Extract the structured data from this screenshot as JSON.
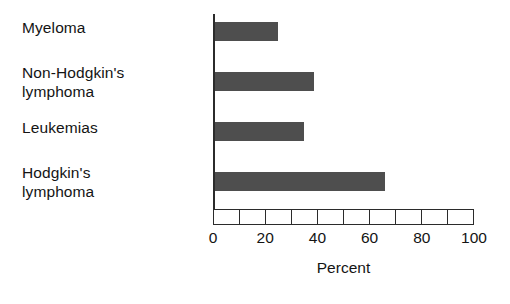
{
  "chart_data": {
    "type": "bar",
    "orientation": "horizontal",
    "title": "",
    "xlabel": "Percent",
    "ylabel": "",
    "categories": [
      "Myeloma",
      "Non-Hodgkin's\nlymphoma",
      "Leukemias",
      "Hodgkin's\nlymphoma"
    ],
    "values": [
      24,
      38,
      34,
      65
    ],
    "xlim": [
      0,
      100
    ],
    "xticks": [
      0,
      20,
      40,
      60,
      80,
      100
    ],
    "xtick_labels": [
      "0",
      "20",
      "40",
      "60",
      "80",
      "100"
    ],
    "minor_tick_interval": 10,
    "grid": false,
    "legend": null,
    "bar_color": "#4e4e4e",
    "axis_color": "#2b2b2b",
    "background": "#ffffff"
  },
  "axis": {
    "cells": [
      "",
      "",
      "",
      "",
      "",
      "",
      "",
      "",
      "",
      ""
    ]
  }
}
